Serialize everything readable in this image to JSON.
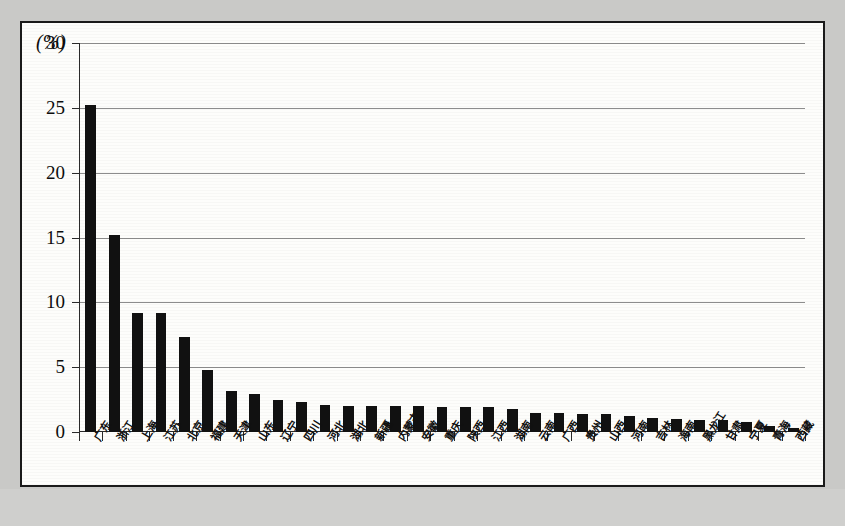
{
  "figure": {
    "unit_label": "(%)",
    "background_color": "#c9c9c7",
    "paper_color": "#fdfdfb",
    "bar_color": "#111111",
    "grid_color": "#8d8d8d"
  },
  "chart_data": {
    "type": "bar",
    "title": "",
    "subtitle": "",
    "xlabel": "",
    "ylabel": "(%)",
    "ylim": [
      0,
      30
    ],
    "yticks": [
      0,
      5,
      10,
      15,
      20,
      25,
      30
    ],
    "ytick_labels": [
      "0",
      "5",
      "10",
      "15",
      "20",
      "25",
      "30"
    ],
    "grid": true,
    "legend": false,
    "categories": [
      "广东",
      "浙江",
      "上海",
      "江苏",
      "北京",
      "福建",
      "天津",
      "山东",
      "辽宁",
      "四川",
      "河北",
      "湖北",
      "新疆",
      "内蒙古",
      "安徽",
      "重庆",
      "陕西",
      "江西",
      "湖南",
      "云南",
      "广西",
      "贵州",
      "山西",
      "河南",
      "吉林",
      "海南",
      "黑龙江",
      "甘肃",
      "宁夏",
      "青海",
      "西藏"
    ],
    "values": [
      25.2,
      15.2,
      9.2,
      9.2,
      7.3,
      4.8,
      3.2,
      2.9,
      2.5,
      2.3,
      2.1,
      2.0,
      2.0,
      2.0,
      2.0,
      1.9,
      1.9,
      1.9,
      1.8,
      1.5,
      1.5,
      1.4,
      1.4,
      1.2,
      1.1,
      1.0,
      0.9,
      0.9,
      0.8,
      0.5,
      0.3
    ]
  }
}
